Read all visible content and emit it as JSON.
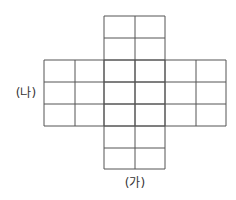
{
  "diagram": {
    "title": "",
    "labels": {
      "vertical_strip": "(가)",
      "horizontal_strip": "(나)"
    },
    "line_color": "#555555",
    "background": "#ffffff",
    "vertical_strip": {
      "x": [
        104,
        135,
        165
      ],
      "y": [
        16,
        38,
        60,
        82,
        104,
        126,
        148,
        169
      ],
      "columns": 2,
      "rows": 7
    },
    "horizontal_strip": {
      "x": [
        44,
        75,
        104,
        135,
        165,
        196,
        226
      ],
      "y": [
        60,
        82,
        104,
        126
      ],
      "columns": 6,
      "rows": 3
    },
    "label_positions": {
      "vertical_strip": [
        135,
        183
      ],
      "horizontal_strip": [
        26,
        93
      ]
    }
  }
}
